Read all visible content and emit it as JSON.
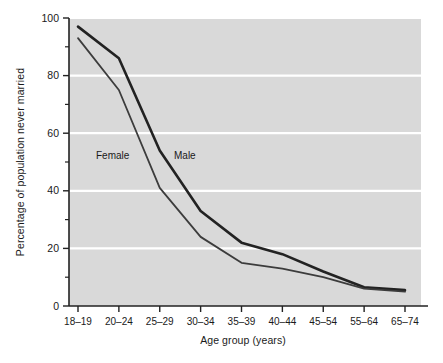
{
  "chart_data": {
    "type": "line",
    "title": "",
    "xlabel": "Age group (years)",
    "ylabel": "Percentage of population never married",
    "categories": [
      "18–19",
      "20–24",
      "25–29",
      "30–34",
      "35–39",
      "40–44",
      "45–54",
      "55–64",
      "65–74"
    ],
    "ylim": [
      0,
      100
    ],
    "yticks": [
      0,
      20,
      40,
      60,
      80,
      100
    ],
    "yticklabels": [
      "0",
      "20",
      "40",
      "60",
      "80",
      "100"
    ],
    "yminorticks": [
      10,
      30,
      50,
      70,
      90
    ],
    "grid": "horizontal-white",
    "legend": "inline-labels",
    "series": [
      {
        "name": "Male",
        "label": "Male",
        "color": "#222222",
        "width": 2.6,
        "values": [
          97,
          86,
          54,
          33,
          22,
          18,
          12,
          6.5,
          5.5
        ]
      },
      {
        "name": "Female",
        "label": "Female",
        "color": "#3c3c3c",
        "width": 1.8,
        "values": [
          93,
          75,
          41,
          24,
          15,
          13,
          10,
          6,
          5
        ]
      }
    ],
    "annotations": [
      {
        "text": "Female",
        "x_px": 96,
        "y_px": 156
      },
      {
        "text": "Male",
        "x_px": 174,
        "y_px": 156
      }
    ],
    "colors": {
      "plot_background": "#d9d9d9",
      "figure_background": "#ffffff",
      "gridline": "#ffffff",
      "axis": "#222222",
      "text": "#1a1a1a"
    }
  },
  "axes": {
    "y_axis_label": "Percentage of population never married",
    "x_axis_label": "Age group (years)"
  }
}
